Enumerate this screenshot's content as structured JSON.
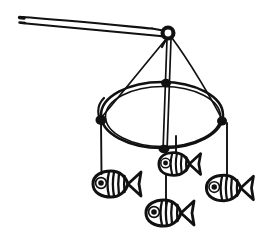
{
  "image": {
    "kind": "line-drawing",
    "subject": "hanging baby mobile with four fish",
    "style": "hand-drawn black ink sketch",
    "background_color": "#ffffff",
    "ink_color": "#111111",
    "width": 262,
    "height": 239
  },
  "parts": {
    "rod": {
      "name": "support-rod",
      "description": "long thin tapered rod angling down from upper-left to the hub",
      "left_end": [
        20,
        18
      ],
      "right_end": [
        166,
        32
      ],
      "thickness": 4
    },
    "hub": {
      "name": "hub-knot",
      "description": "thick ring knot where rod meets the hanging strings",
      "center": [
        168,
        33
      ],
      "outer_radius": 7,
      "inner_radius": 3
    },
    "hoop": {
      "name": "hoop",
      "description": "elliptical ring seen in perspective, drawn with a doubled sketchy stroke",
      "center": [
        162,
        115
      ],
      "radius_x": 61,
      "radius_y": 33
    },
    "suspension_strings": [
      {
        "name": "string-left",
        "from": [
          168,
          33
        ],
        "to": [
          101,
          120
        ]
      },
      {
        "name": "string-center",
        "from": [
          168,
          33
        ],
        "to": [
          166,
          150
        ]
      },
      {
        "name": "string-right",
        "from": [
          168,
          33
        ],
        "to": [
          222,
          121
        ]
      }
    ],
    "hoop_knots": [
      {
        "name": "knot-left",
        "point": [
          101,
          120
        ]
      },
      {
        "name": "knot-back-center",
        "point": [
          166,
          83
        ]
      },
      {
        "name": "knot-right",
        "point": [
          222,
          121
        ]
      },
      {
        "name": "knot-front-center",
        "point": [
          166,
          149
        ]
      }
    ],
    "drop_strings": [
      {
        "name": "drop-string-left",
        "from": [
          101,
          122
        ],
        "to": [
          101,
          172
        ]
      },
      {
        "name": "drop-string-upper-middle",
        "from": [
          166,
          136
        ],
        "to": [
          166,
          156
        ]
      },
      {
        "name": "drop-string-bottom-middle",
        "from": [
          155,
          150
        ],
        "to": [
          155,
          203
        ]
      },
      {
        "name": "drop-string-right",
        "from": [
          227,
          123
        ],
        "to": [
          227,
          177
        ]
      }
    ]
  },
  "fish": [
    {
      "name": "fish-left",
      "position": [
        113,
        184
      ],
      "scale": 1.0,
      "facing": "left",
      "stripe_count": 3,
      "has_eye": true,
      "has_fan_tail": true
    },
    {
      "name": "fish-upper-middle",
      "position": [
        176,
        164
      ],
      "scale": 0.95,
      "facing": "left",
      "stripe_count": 3,
      "has_eye": true,
      "has_fan_tail": true
    },
    {
      "name": "fish-bottom-middle",
      "position": [
        166,
        213
      ],
      "scale": 1.0,
      "facing": "left",
      "stripe_count": 3,
      "has_eye": true,
      "has_fan_tail": true
    },
    {
      "name": "fish-right",
      "position": [
        226,
        188
      ],
      "scale": 0.98,
      "facing": "left",
      "stripe_count": 3,
      "has_eye": true,
      "has_fan_tail": true
    }
  ]
}
